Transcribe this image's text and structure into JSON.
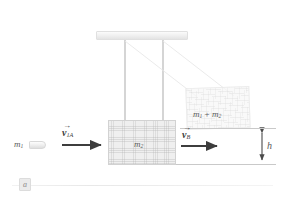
{
  "figure": {
    "panel_label": "a",
    "type": "ballistic-pendulum-diagram",
    "background_color": "#ffffff"
  },
  "labels": {
    "bullet_mass": "m",
    "bullet_mass_sub": "1",
    "block_mass": "m",
    "block_mass_sub": "2",
    "combined_mass": "m",
    "combined_mass_sub1": "1",
    "combined_mass_plus": "+",
    "combined_mass_2": "m",
    "combined_mass_sub2": "2",
    "height": "h"
  },
  "vectors": {
    "initial": {
      "symbol": "v",
      "subscript": "1A",
      "overbar": "→",
      "direction": "right"
    },
    "after": {
      "symbol": "v",
      "subscript": "B",
      "overbar": "→",
      "direction": "right"
    }
  },
  "colors": {
    "wood_fill": "#efefef",
    "wood_border": "#d2d2d2",
    "arrow": "#3d3d3d",
    "label_text": "#5a5a5a",
    "rod": "#dcdcdc",
    "reference_line": "#c9c9c9",
    "ceiling": "#f1f1f1"
  },
  "elements": {
    "ceiling_support": "ceiling-bar",
    "rods": [
      "rod-left",
      "rod-right"
    ],
    "blocks": [
      "block-at-rest",
      "block-swung-up"
    ],
    "projectile": "bullet"
  }
}
